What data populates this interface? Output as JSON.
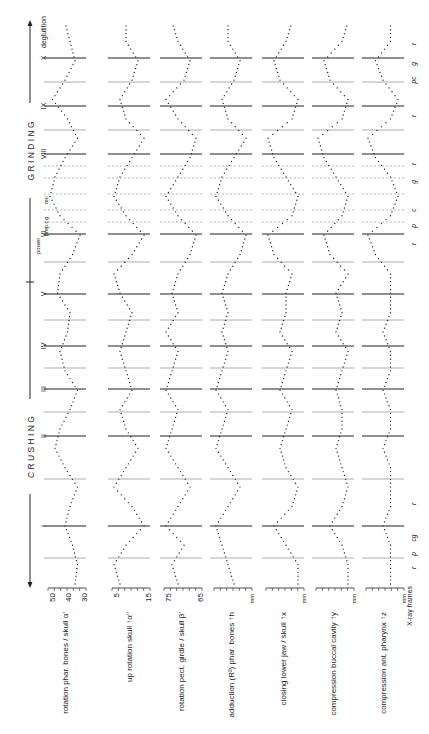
{
  "figure": {
    "phases": {
      "crushing": "C R U S H I N G",
      "grinding": "G R I N D I N G"
    },
    "cycle_labels": [
      "I",
      "II",
      "III",
      "IV",
      "V",
      "VI",
      "VIII",
      "IX",
      "X"
    ],
    "deglutition_label": "deglutition",
    "power_label": "power",
    "phase_markers_top": [
      "prep.c",
      "g",
      "rec"
    ],
    "xaxis_label": "X-ray frames",
    "bottom_markers": [
      "r",
      "p",
      "cg",
      "r",
      "r",
      "p",
      "c",
      "g",
      "r",
      "r",
      "pc",
      "g",
      "r"
    ]
  },
  "chart_data": {
    "type": "line",
    "title": "",
    "xlabel": "X-ray frames",
    "orientation": "rotated 90° counter-clockwise",
    "phases": [
      {
        "name": "CRUSHING",
        "cycles": [
          "I",
          "II",
          "III",
          "IV",
          "V",
          "VI"
        ]
      },
      {
        "name": "GRINDING",
        "cycles": [
          "VIII",
          "IX",
          "X"
        ]
      }
    ],
    "annotations": [
      "deglutition",
      "power",
      "prep.c",
      "g",
      "rec"
    ],
    "series": [
      {
        "name": "rotation phar. bones / skull α'",
        "unit": "°",
        "ticks": [
          "50",
          "40",
          "30"
        ],
        "ylim": [
          30,
          50
        ],
        "values": [
          34,
          33,
          35,
          38,
          36,
          33,
          38,
          42,
          40,
          36,
          33,
          38,
          40,
          37,
          36,
          41,
          40,
          35,
          32,
          40,
          44,
          42,
          38,
          33,
          37,
          43,
          38,
          34,
          36,
          38
        ]
      },
      {
        "name": "up rotation skull ↑α''",
        "unit": "°",
        "ticks": [
          "5",
          "15"
        ],
        "ylim": [
          5,
          15
        ],
        "values": [
          13,
          14,
          12,
          9,
          11,
          14,
          12,
          10,
          12,
          13,
          11,
          12,
          13,
          12,
          11,
          13,
          14,
          11,
          9,
          12,
          14,
          13,
          11,
          9,
          12,
          13,
          11,
          10,
          12,
          12
        ]
      },
      {
        "name": "rotation pect. girdle / skull β'",
        "unit": "°",
        "ticks": [
          "75",
          "65"
        ],
        "ylim": [
          65,
          75
        ],
        "values": [
          68,
          69,
          67,
          70,
          68,
          66,
          68,
          70,
          69,
          68,
          70,
          69,
          68,
          70,
          68,
          69,
          68,
          66,
          65,
          68,
          70,
          68,
          66,
          65,
          68,
          70,
          67,
          66,
          68,
          69
        ]
      },
      {
        "name": "adduction (R²) phar. bones ↑h",
        "unit": "mm",
        "ticks": [],
        "values": [
          3,
          4,
          5,
          6,
          4,
          2,
          4,
          6,
          5,
          4,
          6,
          5,
          4,
          5,
          4,
          5,
          4,
          2,
          1,
          4,
          6,
          5,
          3,
          1,
          4,
          5,
          3,
          2,
          4,
          4
        ]
      },
      {
        "name": "closing lower jaw / skull ↑x",
        "unit": "mm",
        "ticks": [],
        "values": [
          2,
          2,
          4,
          6,
          3,
          2,
          4,
          5,
          4,
          3,
          5,
          4,
          3,
          5,
          4,
          4,
          3,
          6,
          7,
          3,
          2,
          4,
          6,
          7,
          3,
          2,
          5,
          6,
          4,
          3
        ]
      },
      {
        "name": "compression buccal cavity ↑y",
        "unit": "mm",
        "ticks": [],
        "values": [
          3,
          3,
          4,
          6,
          4,
          3,
          4,
          5,
          4,
          4,
          5,
          4,
          3,
          5,
          4,
          5,
          3,
          6,
          7,
          4,
          3,
          5,
          7,
          8,
          4,
          3,
          6,
          7,
          4,
          3
        ]
      },
      {
        "name": "compression ant. pharynx ↑z",
        "unit": "mm",
        "ticks": [],
        "values": [
          3,
          3,
          3,
          4,
          3,
          3,
          3,
          4,
          3,
          3,
          4,
          3,
          3,
          4,
          3,
          3,
          3,
          5,
          6,
          3,
          2,
          3,
          5,
          6,
          3,
          2,
          4,
          5,
          3,
          3
        ]
      }
    ]
  }
}
